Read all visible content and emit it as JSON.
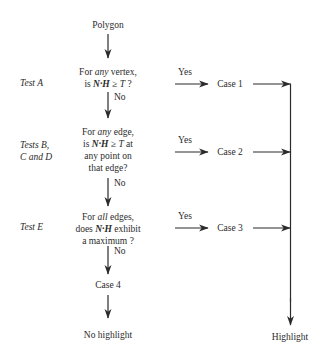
{
  "diagram": {
    "background_color": "#ffffff",
    "ink_color": "#2b2b2b",
    "start": {
      "label": "Polygon"
    },
    "tests": [
      {
        "id": "test-a",
        "name": "Test A",
        "question_lines": [
          "For any vertex,",
          "is N·H ≥ T ?"
        ],
        "question_plain": "For any vertex, is N·H ≥ T ?",
        "emphasis": "any",
        "vector_term": "N·H",
        "threshold_term": "T",
        "yes_label": "Yes",
        "no_label": "No",
        "yes_result": "Case 1"
      },
      {
        "id": "tests-bcd",
        "name_lines": [
          "Tests B,",
          "C and D"
        ],
        "name": "Tests B, C and D",
        "question_lines": [
          "For any edge,",
          "is N·H ≥ T at",
          "any point on",
          "that edge?"
        ],
        "question_plain": "For any edge, is N·H ≥ T at any point on that edge?",
        "emphasis": "any",
        "vector_term": "N·H",
        "threshold_term": "T",
        "yes_label": "Yes",
        "no_label": "No",
        "yes_result": "Case 2"
      },
      {
        "id": "test-e",
        "name": "Test E",
        "question_lines": [
          "For all edges,",
          "does N·H exhibit",
          "a maximum ?"
        ],
        "question_plain": "For all edges, does N·H exhibit a maximum ?",
        "emphasis": "all",
        "vector_term": "N·H",
        "yes_label": "Yes",
        "no_label": "No",
        "yes_result": "Case 3"
      }
    ],
    "fallthrough": {
      "no_label": "No",
      "case_label": "Case 4",
      "terminal": "No highlight"
    },
    "highlight_terminal": "Highlight"
  }
}
